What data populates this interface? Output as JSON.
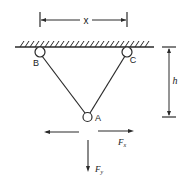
{
  "diagram": {
    "type": "statics-pulley-ring",
    "colors": {
      "line": "#2a2a2a",
      "background": "#ffffff"
    },
    "dimensions": {
      "horizontal": {
        "label": "x"
      },
      "vertical": {
        "label": "h"
      }
    },
    "ceiling": {
      "label": ""
    },
    "nodes": {
      "B": {
        "label": "B",
        "kind": "pulley"
      },
      "C": {
        "label": "C",
        "kind": "pulley"
      },
      "A": {
        "label": "A",
        "kind": "ring"
      }
    },
    "forces": {
      "horizontal": {
        "label": "F",
        "subscript": "x"
      },
      "vertical": {
        "label": "F",
        "subscript": "y"
      }
    }
  }
}
